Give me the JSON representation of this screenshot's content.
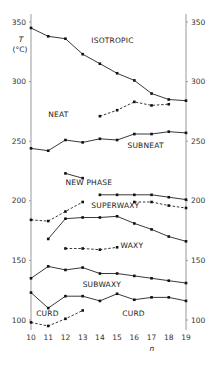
{
  "chart_data": {
    "type": "line",
    "title": "",
    "xlabel": "n",
    "ylabel": "T (°C)",
    "ylabel_lines": [
      "T",
      "(°C)"
    ],
    "xlim": [
      10,
      19
    ],
    "ylim": [
      95,
      352
    ],
    "x_ticks": [
      10,
      11,
      12,
      13,
      14,
      15,
      16,
      17,
      18,
      19
    ],
    "y_ticks_left": [
      100,
      150,
      200,
      250,
      300,
      350
    ],
    "y_ticks_right": [
      100,
      150,
      200,
      250,
      300,
      350
    ],
    "grid": false,
    "legend": "none",
    "series": [
      {
        "name": "isotropic-boundary",
        "style": "solid",
        "x": [
          10,
          11,
          12,
          13,
          14,
          15,
          16,
          17,
          18,
          19
        ],
        "values": [
          345,
          338,
          336,
          323,
          315,
          307,
          301,
          290,
          285,
          284
        ]
      },
      {
        "name": "neat-upper-dashed",
        "style": "dashed",
        "x": [
          14,
          15,
          16,
          17,
          18
        ],
        "values": [
          271,
          276,
          283,
          280,
          281
        ]
      },
      {
        "name": "subneat-boundary",
        "style": "solid",
        "x": [
          10,
          11,
          12,
          13,
          14,
          15,
          16,
          17,
          18,
          19
        ],
        "values": [
          244,
          242,
          251,
          249,
          252,
          251,
          256,
          256,
          258,
          257
        ]
      },
      {
        "name": "new-phase-upper",
        "style": "solid",
        "x": [
          12,
          13
        ],
        "values": [
          223,
          219
        ]
      },
      {
        "name": "superwaxy-upper",
        "style": "solid",
        "x": [
          14,
          15,
          16,
          17,
          18,
          19
        ],
        "values": [
          205,
          205,
          205,
          205,
          203,
          201
        ]
      },
      {
        "name": "superwaxy-upper-dashed",
        "style": "dashed",
        "x": [
          16,
          17,
          18,
          19
        ],
        "values": [
          199,
          199,
          196,
          194
        ]
      },
      {
        "name": "new-phase-lower-dashed",
        "style": "dashed",
        "x": [
          10,
          11,
          12,
          13
        ],
        "values": [
          184,
          183,
          191,
          199
        ]
      },
      {
        "name": "superwaxy-lower",
        "style": "solid",
        "x": [
          11,
          12,
          13,
          14,
          15,
          16,
          17,
          18,
          19
        ],
        "values": [
          168,
          185,
          186,
          186,
          187,
          181,
          176,
          170,
          166
        ]
      },
      {
        "name": "waxy-dashed",
        "style": "dashed",
        "x": [
          12,
          13,
          14,
          15
        ],
        "values": [
          160,
          160,
          159,
          161
        ]
      },
      {
        "name": "subwaxy-upper",
        "style": "solid",
        "x": [
          10,
          11,
          12,
          13,
          14,
          15,
          16,
          17,
          18,
          19
        ],
        "values": [
          135,
          145,
          142,
          144,
          139,
          139,
          137,
          135,
          133,
          131
        ]
      },
      {
        "name": "subwaxy-lower",
        "style": "solid",
        "x": [
          10,
          11,
          12,
          13,
          14,
          15,
          16,
          17,
          18,
          19
        ],
        "values": [
          123,
          110,
          120,
          120,
          116,
          122,
          117,
          119,
          119,
          116
        ]
      },
      {
        "name": "curd-lower",
        "style": "dashed",
        "x": [
          10,
          11,
          12,
          13
        ],
        "values": [
          98,
          95,
          101,
          108
        ]
      }
    ],
    "annotations": [
      {
        "text": "ISOTROPIC",
        "x": 13.5,
        "y": 332
      },
      {
        "text": "NEAT",
        "x": 11.0,
        "y": 270
      },
      {
        "text": "SUBNEAT",
        "x": 15.6,
        "y": 244
      },
      {
        "text": "NEW PHASE",
        "x": 12.0,
        "y": 213
      },
      {
        "text": "SUPERWAXY",
        "x": 13.5,
        "y": 194
      },
      {
        "text": "WAXY",
        "x": 15.2,
        "y": 160
      },
      {
        "text": "SUBWAXY",
        "x": 13.0,
        "y": 128
      },
      {
        "text": "CURD",
        "x": 10.3,
        "y": 103
      },
      {
        "text": "CURD",
        "x": 15.3,
        "y": 103
      }
    ]
  }
}
